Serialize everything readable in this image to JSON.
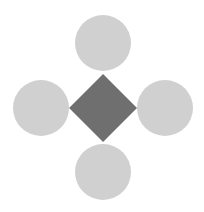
{
  "diagram": {
    "background": "#ffffff",
    "center": {
      "shape": "diamond",
      "color": "#6f6f6f",
      "cx": 103,
      "cy": 108,
      "half_diagonal": 34
    },
    "satellites": [
      {
        "name": "top",
        "shape": "circle",
        "color": "#d0d0d0",
        "cx": 103,
        "cy": 43,
        "r": 28
      },
      {
        "name": "left",
        "shape": "circle",
        "color": "#d0d0d0",
        "cx": 41,
        "cy": 108,
        "r": 28
      },
      {
        "name": "right",
        "shape": "circle",
        "color": "#d0d0d0",
        "cx": 165,
        "cy": 108,
        "r": 28
      },
      {
        "name": "bottom",
        "shape": "circle",
        "color": "#d0d0d0",
        "cx": 103,
        "cy": 172,
        "r": 28
      }
    ]
  }
}
